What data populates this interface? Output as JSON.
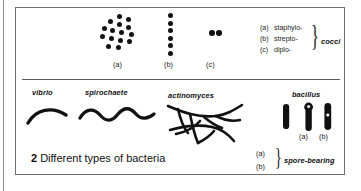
{
  "figure": {
    "caption_number": "2",
    "caption_text": "Different types of bacteria"
  },
  "panel_cocci": {
    "labels": [
      {
        "id": "a",
        "text": "(a)"
      },
      {
        "id": "b",
        "text": "(b)"
      },
      {
        "id": "c",
        "text": "(c)"
      }
    ],
    "legend": {
      "rows": [
        {
          "key": "(a)",
          "name": "staphylo-"
        },
        {
          "key": "(b)",
          "name": "strepto-"
        },
        {
          "key": "(c)",
          "name": "diplo-"
        }
      ],
      "group_label": "cocci"
    },
    "shapes": {
      "staphylococci": {
        "icon": "cluster-of-cocci-icon",
        "count": 15,
        "arrangement": "irregular grape-like cluster"
      },
      "streptococci": {
        "icon": "chain-of-cocci-icon",
        "count": 6,
        "arrangement": "vertical chain"
      },
      "diplococci": {
        "icon": "pair-of-cocci-icon",
        "count": 2,
        "arrangement": "pair"
      }
    }
  },
  "panel_other": {
    "names": {
      "vibrio": "vibrio",
      "spirochaete": "spirochaete",
      "actinomyces": "actinomyces",
      "bacillus": "bacillus"
    },
    "bacillus_labels": [
      {
        "id": "a",
        "text": "(a)"
      },
      {
        "id": "b",
        "text": "(b)"
      }
    ],
    "spore_legend": {
      "rows": [
        {
          "key": "(a)"
        },
        {
          "key": "(b)"
        }
      ],
      "group_label": "spore-bearing"
    },
    "shapes": {
      "vibrio": {
        "icon": "comma-curve-icon",
        "description": "short curved comma rod"
      },
      "spirochaete": {
        "icon": "wavy-line-icon",
        "description": "long helical wavy filament"
      },
      "actinomyces": {
        "icon": "branching-filament-icon",
        "description": "branching filamentous network"
      },
      "bacillus_plain": {
        "icon": "rod-icon",
        "description": "plain rod"
      },
      "bacillus_terminal_spore": {
        "icon": "rod-terminal-spore-icon",
        "description": "rod with terminal spore"
      },
      "bacillus_central_spore": {
        "icon": "rod-central-spore-icon",
        "description": "rod with central spore"
      }
    }
  },
  "colors": {
    "ink": "#111111",
    "border": "#6f6f6f",
    "page_rule": "#8d8d8d",
    "background": "#ffffff"
  }
}
